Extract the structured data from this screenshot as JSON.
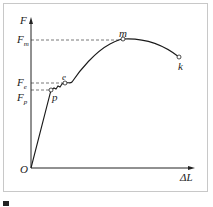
{
  "diagram": {
    "axes": {
      "y_label": "F",
      "x_label": "ΔL",
      "origin_label": "O"
    },
    "y_ticks": [
      {
        "base": "F",
        "sub": "m",
        "y": 40
      },
      {
        "base": "F",
        "sub": "e",
        "y": 83
      },
      {
        "base": "F",
        "sub": "p",
        "y": 97
      }
    ],
    "points": [
      {
        "name": "p",
        "x": 51,
        "y": 90
      },
      {
        "name": "e",
        "x": 65,
        "y": 83
      },
      {
        "name": "m",
        "x": 123,
        "y": 39
      },
      {
        "name": "k",
        "x": 179,
        "y": 57
      }
    ],
    "colors": {
      "curve": "#1a1a1a",
      "dash": "#555555",
      "frame": "#c8c8c8"
    }
  },
  "caption": {
    "marker": "■"
  }
}
